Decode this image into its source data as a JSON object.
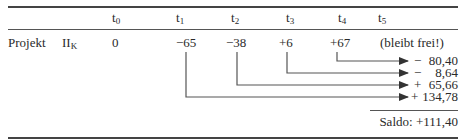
{
  "table": {
    "header": {
      "cols": [
        {
          "base": "t",
          "sub": "0"
        },
        {
          "base": "t",
          "sub": "1"
        },
        {
          "base": "t",
          "sub": "2"
        },
        {
          "base": "t",
          "sub": "3"
        },
        {
          "base": "t",
          "sub": "4"
        },
        {
          "base": "t",
          "sub": "5"
        }
      ]
    },
    "row": {
      "label": "Projekt",
      "symbol": {
        "base": "II",
        "sub": "K"
      },
      "values": [
        "0",
        "−65",
        "−38",
        "+6",
        "+67"
      ],
      "t5_note": "(bleibt frei!)"
    },
    "compounded": [
      {
        "from": "t4",
        "sign": "−",
        "value": "80,40"
      },
      {
        "from": "t3",
        "sign": "−",
        "value": "8,64"
      },
      {
        "from": "t2",
        "sign": "+",
        "value": "65,66"
      },
      {
        "from": "t1",
        "sign": "+",
        "value": "134,78"
      }
    ],
    "saldo": {
      "label": "Saldo:",
      "value": "+111,40"
    }
  },
  "colors": {
    "text": "#2a2a2a",
    "lines": "#555555"
  }
}
